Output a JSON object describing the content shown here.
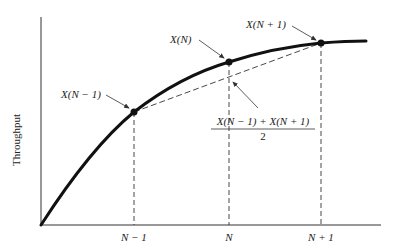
{
  "diagram": {
    "type": "concave throughput curve with chord",
    "y_axis_label": "Throughput",
    "x_tick_labels": [
      "N − 1",
      "N",
      "N + 1"
    ],
    "point_labels": {
      "prev": "X(N − 1)",
      "curr": "X(N)",
      "next": "X(N + 1)"
    },
    "midpoint_label": {
      "numerator": "X(N − 1) + X(N + 1)",
      "denominator": "2"
    },
    "colors": {
      "ink": "#111111",
      "background": "#ffffff"
    }
  }
}
